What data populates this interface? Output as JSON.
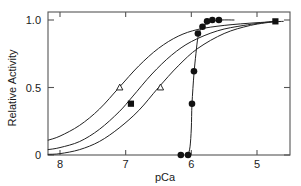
{
  "chart_data": {
    "type": "line",
    "title": "",
    "xlabel": "pCa",
    "ylabel": "Relative Activity",
    "xlim": [
      8.18,
      4.5
    ],
    "ylim": [
      -0.04,
      1.09
    ],
    "x_ticks": [
      8,
      7,
      6,
      5
    ],
    "x_tick_labels": [
      "8",
      "7",
      "6",
      "5"
    ],
    "y_ticks": [
      0,
      0.5,
      1.0
    ],
    "y_tick_labels": [
      "0",
      "0.5",
      "1.0"
    ],
    "x_axis_inverted": true,
    "grid": false,
    "legend": false,
    "frame": "box",
    "series": [
      {
        "name": "curve-1-leftmost",
        "style": "solid-line",
        "marker": "open-triangle",
        "points": [
          {
            "x": 8.18,
            "y": 0.11
          },
          {
            "x": 8.0,
            "y": 0.14
          },
          {
            "x": 7.7,
            "y": 0.22
          },
          {
            "x": 7.4,
            "y": 0.34
          },
          {
            "x": 7.1,
            "y": 0.5
          },
          {
            "x": 6.8,
            "y": 0.66
          },
          {
            "x": 6.5,
            "y": 0.79
          },
          {
            "x": 6.2,
            "y": 0.88
          },
          {
            "x": 5.9,
            "y": 0.93
          },
          {
            "x": 5.5,
            "y": 0.96
          },
          {
            "x": 5.0,
            "y": 0.98
          },
          {
            "x": 4.6,
            "y": 0.99
          }
        ],
        "marker_points": [
          {
            "x": 7.09,
            "y": 0.5
          }
        ]
      },
      {
        "name": "curve-2-middle",
        "style": "solid-line",
        "marker": "filled-square",
        "points": [
          {
            "x": 8.18,
            "y": 0.04
          },
          {
            "x": 8.0,
            "y": 0.055
          },
          {
            "x": 7.7,
            "y": 0.1
          },
          {
            "x": 7.4,
            "y": 0.19
          },
          {
            "x": 7.1,
            "y": 0.32
          },
          {
            "x": 6.9,
            "y": 0.43
          },
          {
            "x": 6.6,
            "y": 0.6
          },
          {
            "x": 6.3,
            "y": 0.74
          },
          {
            "x": 6.0,
            "y": 0.84
          },
          {
            "x": 5.6,
            "y": 0.92
          },
          {
            "x": 5.2,
            "y": 0.96
          },
          {
            "x": 4.75,
            "y": 0.99
          }
        ],
        "marker_points": [
          {
            "x": 6.92,
            "y": 0.38
          },
          {
            "x": 4.72,
            "y": 0.99
          }
        ]
      },
      {
        "name": "curve-3-right-sigmoid",
        "style": "solid-line",
        "marker": "open-triangle",
        "points": [
          {
            "x": 8.18,
            "y": 0.005
          },
          {
            "x": 8.0,
            "y": 0.01
          },
          {
            "x": 7.7,
            "y": 0.04
          },
          {
            "x": 7.4,
            "y": 0.1
          },
          {
            "x": 7.1,
            "y": 0.2
          },
          {
            "x": 6.8,
            "y": 0.33
          },
          {
            "x": 6.5,
            "y": 0.5
          },
          {
            "x": 6.2,
            "y": 0.66
          },
          {
            "x": 5.9,
            "y": 0.79
          },
          {
            "x": 5.5,
            "y": 0.9
          },
          {
            "x": 5.1,
            "y": 0.96
          },
          {
            "x": 4.7,
            "y": 0.99
          }
        ],
        "marker_points": [
          {
            "x": 6.47,
            "y": 0.5
          }
        ]
      },
      {
        "name": "curve-4-steep-filled-circles",
        "style": "solid-line",
        "marker": "filled-circle",
        "points": [
          {
            "x": 6.05,
            "y": 0.0
          },
          {
            "x": 6.02,
            "y": 0.06
          },
          {
            "x": 6.0,
            "y": 0.2
          },
          {
            "x": 5.99,
            "y": 0.38
          },
          {
            "x": 5.96,
            "y": 0.6
          },
          {
            "x": 5.93,
            "y": 0.75
          },
          {
            "x": 5.9,
            "y": 0.87
          },
          {
            "x": 5.86,
            "y": 0.93
          },
          {
            "x": 5.8,
            "y": 0.96
          },
          {
            "x": 5.7,
            "y": 0.99
          },
          {
            "x": 5.55,
            "y": 1.0
          },
          {
            "x": 5.35,
            "y": 1.0
          }
        ],
        "marker_points": [
          {
            "x": 6.16,
            "y": 0.0
          },
          {
            "x": 6.05,
            "y": 0.0
          },
          {
            "x": 5.99,
            "y": 0.38
          },
          {
            "x": 5.96,
            "y": 0.62
          },
          {
            "x": 5.9,
            "y": 0.9
          },
          {
            "x": 5.83,
            "y": 0.95
          },
          {
            "x": 5.76,
            "y": 0.99
          },
          {
            "x": 5.68,
            "y": 1.0
          },
          {
            "x": 5.58,
            "y": 1.0
          }
        ]
      }
    ]
  },
  "axes": {
    "x_label": "pCa",
    "y_label": "Relative Activity",
    "x_tick_labels": [
      "8",
      "7",
      "6",
      "5"
    ],
    "y_tick_labels": [
      "1.0",
      "0.5",
      "0"
    ]
  },
  "colors": {
    "line": "#222222",
    "marker": "#111111",
    "axis": "#555555",
    "background": "#ffffff",
    "text": "#1a1a1a"
  }
}
